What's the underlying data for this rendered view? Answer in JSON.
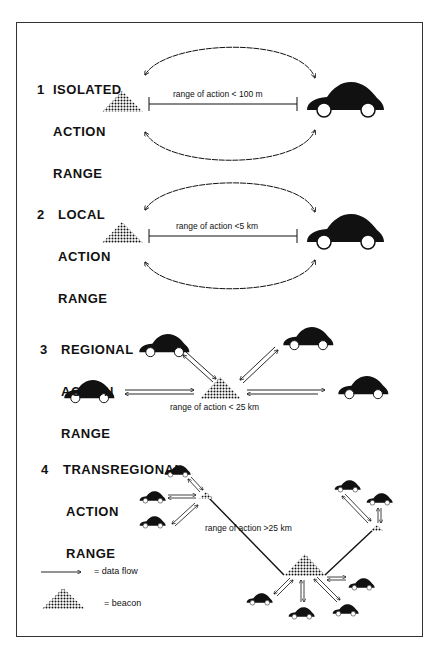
{
  "diagram": {
    "sections": [
      {
        "number": "1",
        "title_lines": [
          "ISOLATED",
          "ACTION",
          "RANGE"
        ],
        "range_label": "range of action < 100 m"
      },
      {
        "number": "2",
        "title_lines": [
          "LOCAL",
          "ACTION",
          "RANGE"
        ],
        "range_label": "range of action <5 km"
      },
      {
        "number": "3",
        "title_lines": [
          "REGIONAL",
          "ACTION",
          "RANGE"
        ],
        "range_label": "range of action < 25 km"
      },
      {
        "number": "4",
        "title_lines": [
          "TRANSREGIONAL",
          "ACTION",
          "RANGE"
        ],
        "range_label": "range of action >25 km"
      }
    ],
    "legend": {
      "data_flow": "=  data flow",
      "beacon": "=  beacon"
    },
    "colors": {
      "ink": "#111111",
      "background": "#ffffff",
      "border": "#333333"
    }
  }
}
